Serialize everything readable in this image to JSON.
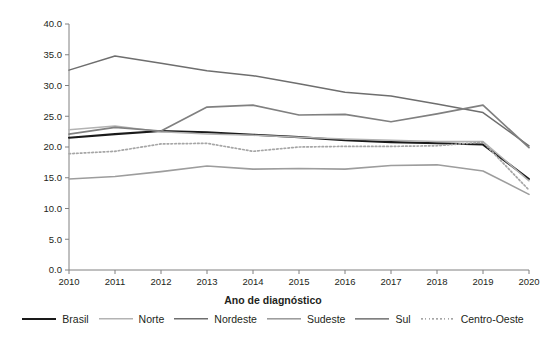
{
  "chart_data": {
    "type": "line",
    "title": "",
    "xlabel": "Ano de diagnóstico",
    "ylabel": "Taxa de detecção (x100 mil hab.)",
    "x": [
      2010,
      2011,
      2012,
      2013,
      2014,
      2015,
      2016,
      2017,
      2018,
      2019,
      2020
    ],
    "xtick_labels": [
      "2010",
      "2011",
      "2012",
      "2013",
      "2014",
      "2015",
      "2016",
      "2017",
      "2018",
      "2019",
      "2020"
    ],
    "ytick_labels": [
      "0.0",
      "5.0",
      "10.0",
      "15.0",
      "20.0",
      "25.0",
      "30.0",
      "35.0",
      "40.0"
    ],
    "ytick_values": [
      0.0,
      5.0,
      10.0,
      15.0,
      20.0,
      25.0,
      30.0,
      35.0,
      40.0
    ],
    "ylim": [
      0.0,
      40.0
    ],
    "xlim": [
      2010,
      2020
    ],
    "grid": false,
    "legend_position": "bottom",
    "series": [
      {
        "name": "Brasil",
        "color": "#1a1a1a",
        "width": 2.1,
        "dash": "none",
        "values": [
          21.5,
          22.1,
          22.6,
          22.4,
          22.0,
          21.6,
          21.1,
          20.8,
          20.6,
          20.4,
          14.8
        ]
      },
      {
        "name": "Norte",
        "color": "#b3b3b3",
        "width": 1.5,
        "dash": "none",
        "values": [
          22.8,
          23.4,
          22.5,
          22.1,
          21.9,
          21.6,
          21.3,
          21.1,
          20.9,
          20.9,
          14.5
        ]
      },
      {
        "name": "Nordeste",
        "color": "#6e6e6e",
        "width": 1.5,
        "dash": "none",
        "values": [
          32.5,
          34.8,
          33.6,
          32.4,
          31.6,
          30.3,
          28.9,
          28.3,
          27.0,
          25.6,
          20.2
        ]
      },
      {
        "name": "Sudeste",
        "color": "#9d9d9d",
        "width": 1.6,
        "dash": "none",
        "values": [
          14.8,
          15.2,
          16.0,
          16.9,
          16.4,
          16.5,
          16.4,
          17.0,
          17.1,
          16.1,
          12.3
        ]
      },
      {
        "name": "Sul",
        "color": "#808080",
        "width": 1.7,
        "dash": "none",
        "values": [
          22.1,
          23.2,
          22.6,
          26.5,
          26.8,
          25.2,
          25.3,
          24.1,
          25.4,
          26.8,
          19.9
        ]
      },
      {
        "name": "Centro-Oeste",
        "color": "#a6a6a6",
        "width": 1.7,
        "dash": "dotted",
        "values": [
          18.9,
          19.3,
          20.5,
          20.6,
          19.3,
          20.0,
          20.1,
          20.1,
          20.2,
          20.8,
          13.0
        ]
      }
    ]
  },
  "legend": {
    "items": [
      {
        "label": "Brasil"
      },
      {
        "label": "Norte"
      },
      {
        "label": "Nordeste"
      },
      {
        "label": "Sudeste"
      },
      {
        "label": "Sul"
      },
      {
        "label": "Centro-Oeste"
      }
    ]
  }
}
